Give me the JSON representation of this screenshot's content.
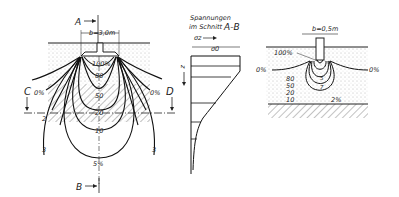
{
  "left_figure": {
    "section_top_label": "A",
    "section_bottom_label": "B",
    "left_marker": "C",
    "right_marker": "D",
    "width_label": "b=3,0m",
    "left_zero": "0%",
    "right_zero": "0%",
    "isobars": [
      "100%",
      "80",
      "50",
      "20",
      "10",
      "5%"
    ],
    "layer_labels": {
      "two": "2",
      "three_left": "3",
      "three_right": "3"
    }
  },
  "stress_profile": {
    "title_line1": "Spannungen",
    "title_line2": "im Schnitt",
    "section": "A-B",
    "sigma_z": "σz",
    "sigma_0": "σ0",
    "depth_axis": "z"
  },
  "right_figure": {
    "width_label": "b=0,5m",
    "top_label": "100%",
    "left_zero": "0%",
    "right_zero": "0%",
    "isobars": [
      "80",
      "50",
      "20",
      "10"
    ],
    "inner_labels": [
      "5",
      "7"
    ],
    "outer_label": "2%"
  }
}
